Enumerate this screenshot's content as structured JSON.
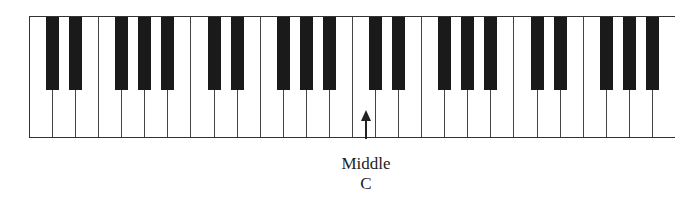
{
  "diagram": {
    "type": "piano-keyboard",
    "octaves": 4,
    "white_keys_per_octave": [
      "C",
      "D",
      "E",
      "F",
      "G",
      "A",
      "B"
    ],
    "black_keys_per_octave": [
      "C#",
      "D#",
      "F#",
      "G#",
      "A#"
    ],
    "white_key_count": 28,
    "black_key_count": 20,
    "colors": {
      "white_key": "#ffffff",
      "black_key": "#1a1a1a",
      "outline": "#333333"
    },
    "annotation": {
      "label_line1": "Middle",
      "label_line2": "C",
      "points_to_white_key_index": 14
    }
  }
}
